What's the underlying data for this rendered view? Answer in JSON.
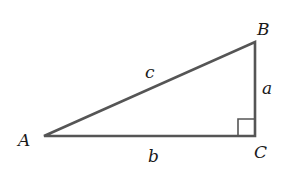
{
  "diagram": {
    "stroke_color": "#555555",
    "label_color": "#1a1a1a",
    "vertices": [
      {
        "name": "A",
        "x": 44,
        "y": 136,
        "label_x": 18,
        "label_y": 146
      },
      {
        "name": "B",
        "x": 255,
        "y": 42,
        "label_x": 257,
        "label_y": 35
      },
      {
        "name": "C",
        "x": 255,
        "y": 136,
        "label_x": 254,
        "label_y": 158
      }
    ],
    "sides": [
      {
        "name": "a",
        "from": "B",
        "to": "C",
        "label_x": 262,
        "label_y": 94
      },
      {
        "name": "b",
        "from": "A",
        "to": "C",
        "label_x": 148,
        "label_y": 162
      },
      {
        "name": "c",
        "from": "A",
        "to": "B",
        "label_x": 145,
        "label_y": 78
      }
    ],
    "right_angle_marker": {
      "vertex": "C",
      "size": 17
    }
  }
}
